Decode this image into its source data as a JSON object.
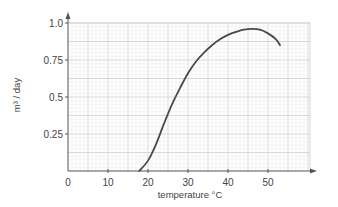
{
  "chart_data": {
    "type": "line",
    "title": "",
    "xlabel": "temperature °C",
    "ylabel": "m³ / day",
    "xlim": [
      0,
      60
    ],
    "ylim": [
      0,
      1.0
    ],
    "x_ticks": [
      "0",
      "10",
      "20",
      "30",
      "40",
      "50"
    ],
    "y_ticks": [
      "0.25",
      "0.5",
      "0.75",
      "1.0"
    ],
    "grid": true,
    "legend": null,
    "series": [
      {
        "name": "curve",
        "x": [
          17.8,
          20,
          22,
          24,
          26,
          28,
          30,
          32,
          34,
          36,
          38,
          40,
          42,
          44,
          46,
          48,
          50,
          52,
          53
        ],
        "y": [
          0.0,
          0.07,
          0.18,
          0.32,
          0.45,
          0.56,
          0.66,
          0.74,
          0.8,
          0.85,
          0.89,
          0.92,
          0.94,
          0.955,
          0.96,
          0.955,
          0.93,
          0.89,
          0.85
        ]
      }
    ]
  },
  "labels": {
    "x_axis": "temperature °C",
    "y_axis": "m³ / day",
    "x_ticks": [
      "0",
      "10",
      "20",
      "30",
      "40",
      "50"
    ],
    "y_ticks": [
      "0.25",
      "0.5",
      "0.75",
      "1.0"
    ]
  }
}
